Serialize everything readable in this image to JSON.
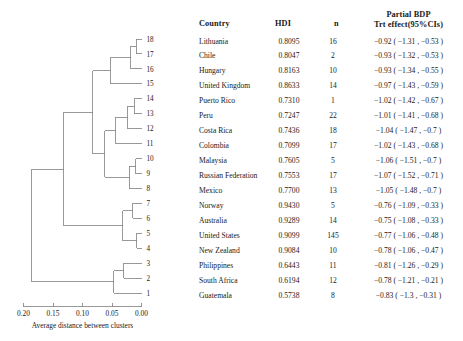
{
  "figure": {
    "axis_title": "Average distance between clusters",
    "x_ticks": [
      "0.20",
      "0.15",
      "0.10",
      "0.05",
      "0.00"
    ],
    "x_tick_values": [
      0.2,
      0.15,
      0.1,
      0.05,
      0.0
    ],
    "line_color": "#808080"
  },
  "table": {
    "headers": {
      "country": "Country",
      "hdi": "HDI",
      "n": "n",
      "trt_line1": "Partial BDP",
      "trt_line2": "Trt effect(95%CIs)"
    }
  },
  "chart_data": {
    "type": "dendrogram",
    "title": "",
    "xlabel": "Average distance between clusters",
    "ylabel": "",
    "xlim": [
      0.2,
      0.0
    ],
    "x_reversed": true,
    "grid": false,
    "legend": "none",
    "leaf_order_top_to_bottom": [
      18,
      17,
      16,
      15,
      14,
      13,
      12,
      11,
      10,
      9,
      8,
      7,
      6,
      5,
      4,
      3,
      2,
      1
    ],
    "leaves": [
      {
        "id": 18,
        "country": "Lithuania",
        "hdi": 0.8095,
        "n": 16,
        "trt_effect": -0.92,
        "ci_low": -1.31,
        "ci_high": -0.53,
        "trt_label": "−0.92 ( −1.31 , −0.53 )"
      },
      {
        "id": 17,
        "country": "Chile",
        "hdi": 0.8047,
        "n": 2,
        "trt_effect": -0.93,
        "ci_low": -1.32,
        "ci_high": -0.53,
        "trt_label": "−0.93 ( −1.32 , −0.53 )"
      },
      {
        "id": 16,
        "country": "Hungary",
        "hdi": 0.8163,
        "n": 10,
        "trt_effect": -0.93,
        "ci_low": -1.34,
        "ci_high": -0.55,
        "trt_label": "−0.93 ( −1.34 , −0.55 )"
      },
      {
        "id": 15,
        "country": "United Kingdom",
        "hdi": 0.8633,
        "n": 14,
        "trt_effect": -0.97,
        "ci_low": -1.43,
        "ci_high": -0.59,
        "trt_label": "−0.97 ( −1.43 , −0.59 )"
      },
      {
        "id": 14,
        "country": "Puerto Rico",
        "hdi": 0.731,
        "n": 1,
        "trt_effect": -1.02,
        "ci_low": -1.42,
        "ci_high": -0.67,
        "trt_label": "−1.02 ( −1.42 , −0.67 )"
      },
      {
        "id": 13,
        "country": "Peru",
        "hdi": 0.7247,
        "n": 22,
        "trt_effect": -1.01,
        "ci_low": -1.41,
        "ci_high": -0.68,
        "trt_label": "−1.01 ( −1.41 , −0.68 )"
      },
      {
        "id": 12,
        "country": "Costa Rica",
        "hdi": 0.7436,
        "n": 18,
        "trt_effect": -1.04,
        "ci_low": -1.47,
        "ci_high": -0.7,
        "trt_label": "−1.04 ( −1.47 , −0.7 )"
      },
      {
        "id": 11,
        "country": "Colombia",
        "hdi": 0.7099,
        "n": 17,
        "trt_effect": -1.02,
        "ci_low": -1.43,
        "ci_high": -0.68,
        "trt_label": "−1.02 ( −1.43 , −0.68 )"
      },
      {
        "id": 10,
        "country": "Malaysia",
        "hdi": 0.7605,
        "n": 5,
        "trt_effect": -1.06,
        "ci_low": -1.51,
        "ci_high": -0.7,
        "trt_label": "−1.06 ( −1.51 , −0.7 )"
      },
      {
        "id": 9,
        "country": "Russian Federation",
        "hdi": 0.7553,
        "n": 17,
        "trt_effect": -1.07,
        "ci_low": -1.52,
        "ci_high": -0.71,
        "trt_label": "−1.07 ( −1.52 , −0.71 )"
      },
      {
        "id": 8,
        "country": "Mexico",
        "hdi": 0.77,
        "n": 13,
        "trt_effect": -1.05,
        "ci_low": -1.48,
        "ci_high": -0.7,
        "trt_label": "−1.05 ( −1.48 , −0.7 )"
      },
      {
        "id": 7,
        "country": "Norway",
        "hdi": 0.943,
        "n": 5,
        "trt_effect": -0.76,
        "ci_low": -1.09,
        "ci_high": -0.33,
        "trt_label": "−0.76 ( −1.09 , −0.33 )"
      },
      {
        "id": 6,
        "country": "Australia",
        "hdi": 0.9289,
        "n": 14,
        "trt_effect": -0.75,
        "ci_low": -1.08,
        "ci_high": -0.33,
        "trt_label": "−0.75 ( −1.08 , −0.33 )"
      },
      {
        "id": 5,
        "country": "United States",
        "hdi": 0.9099,
        "n": 145,
        "trt_effect": -0.77,
        "ci_low": -1.06,
        "ci_high": -0.48,
        "trt_label": "−0.77 ( −1.06 , −0.48 )"
      },
      {
        "id": 4,
        "country": "New Zealand",
        "hdi": 0.9084,
        "n": 10,
        "trt_effect": -0.78,
        "ci_low": -1.06,
        "ci_high": -0.47,
        "trt_label": "−0.78 ( −1.06 , −0.47 )"
      },
      {
        "id": 3,
        "country": "Philippines",
        "hdi": 0.6443,
        "n": 11,
        "trt_effect": -0.81,
        "ci_low": -1.26,
        "ci_high": -0.29,
        "trt_label": "−0.81 ( −1.26 , −0.29 )"
      },
      {
        "id": 2,
        "country": "South Africa",
        "hdi": 0.6194,
        "n": 12,
        "trt_effect": -0.78,
        "ci_low": -1.21,
        "ci_high": -0.21,
        "trt_label": "−0.78 ( −1.21 , −0.21 )"
      },
      {
        "id": 1,
        "country": "Guatemala",
        "hdi": 0.5738,
        "n": 8,
        "trt_effect": -0.83,
        "ci_low": -1.3,
        "ci_high": -0.31,
        "trt_label": "−0.83 ( −1.3 , −0.31 )"
      }
    ],
    "merges": [
      {
        "name": "m1",
        "children": [
          "leaf:18",
          "leaf:17"
        ],
        "height": 0.009
      },
      {
        "name": "m2",
        "children": [
          "m1",
          "leaf:16"
        ],
        "height": 0.018
      },
      {
        "name": "m3",
        "children": [
          "m2",
          "leaf:15"
        ],
        "height": 0.053
      },
      {
        "name": "m4",
        "children": [
          "leaf:14",
          "leaf:13"
        ],
        "height": 0.012
      },
      {
        "name": "m5",
        "children": [
          "m4",
          "leaf:12"
        ],
        "height": 0.023
      },
      {
        "name": "m6",
        "children": [
          "m5",
          "leaf:11"
        ],
        "height": 0.044
      },
      {
        "name": "m7",
        "children": [
          "leaf:10",
          "leaf:9"
        ],
        "height": 0.01
      },
      {
        "name": "m8",
        "children": [
          "m7",
          "leaf:8"
        ],
        "height": 0.021
      },
      {
        "name": "m9",
        "children": [
          "m6",
          "m8"
        ],
        "height": 0.062
      },
      {
        "name": "m10",
        "children": [
          "m3",
          "m9"
        ],
        "height": 0.083
      },
      {
        "name": "m11",
        "children": [
          "leaf:7",
          "leaf:6"
        ],
        "height": 0.015
      },
      {
        "name": "m12",
        "children": [
          "leaf:5",
          "leaf:4"
        ],
        "height": 0.008
      },
      {
        "name": "m13",
        "children": [
          "m11",
          "m12"
        ],
        "height": 0.032
      },
      {
        "name": "m14",
        "children": [
          "m10",
          "m13"
        ],
        "height": 0.132
      },
      {
        "name": "m15",
        "children": [
          "leaf:3",
          "leaf:2"
        ],
        "height": 0.03
      },
      {
        "name": "m16",
        "children": [
          "m15",
          "leaf:1"
        ],
        "height": 0.047
      },
      {
        "name": "m17",
        "children": [
          "m14",
          "m16"
        ],
        "height": 0.186
      }
    ]
  }
}
